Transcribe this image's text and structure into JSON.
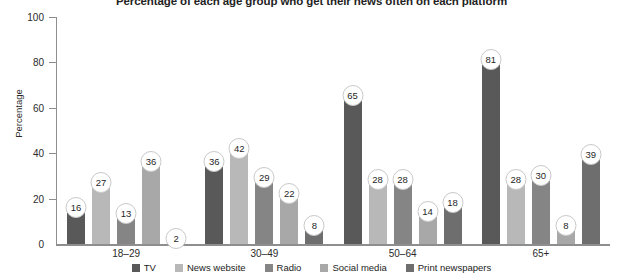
{
  "chart_data": {
    "type": "bar",
    "title": "Percentage of each age group who get their news often on each platform",
    "xlabel": "",
    "ylabel": "Percentage",
    "ylim": [
      0,
      100
    ],
    "yticks": [
      0,
      20,
      40,
      60,
      80,
      100
    ],
    "grid": false,
    "legend_position": "bottom",
    "categories": [
      "18–29",
      "30–49",
      "50–64",
      "65+"
    ],
    "series": [
      {
        "name": "TV",
        "values": [
          16,
          36,
          65,
          81
        ],
        "color": "#595959"
      },
      {
        "name": "News website",
        "values": [
          27,
          42,
          28,
          28
        ],
        "color": "#b8b8b8"
      },
      {
        "name": "Radio",
        "values": [
          13,
          29,
          28,
          30
        ],
        "color": "#858585"
      },
      {
        "name": "Social media",
        "values": [
          36,
          22,
          14,
          8
        ],
        "color": "#a8a8a8"
      },
      {
        "name": "Print newspapers",
        "values": [
          2,
          8,
          18,
          39
        ],
        "color": "#6e6e6e"
      }
    ]
  },
  "axis": {
    "y_tick_labels": [
      "0",
      "20",
      "40",
      "60",
      "80",
      "100"
    ],
    "y_title": "Percentage"
  },
  "legend": {
    "items": [
      {
        "label": "TV"
      },
      {
        "label": "News website"
      },
      {
        "label": "Radio"
      },
      {
        "label": "Social media"
      },
      {
        "label": "Print newspapers"
      }
    ]
  }
}
